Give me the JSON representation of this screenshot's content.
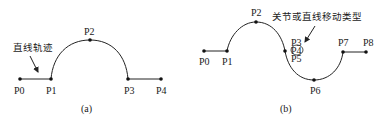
{
  "diagram_a": {
    "caption": "(a)",
    "annotation": "直线轨迹",
    "points": [
      {
        "label": "P0",
        "x": 20,
        "y": 79
      },
      {
        "label": "P1",
        "x": 51,
        "y": 79
      },
      {
        "label": "P2",
        "x": 90,
        "y": 40
      },
      {
        "label": "P3",
        "x": 128,
        "y": 79
      },
      {
        "label": "P4",
        "x": 161,
        "y": 79
      }
    ]
  },
  "diagram_b": {
    "caption": "(b)",
    "annotation": "关节或直线移动类型",
    "points": [
      {
        "label": "P0",
        "x": 204,
        "y": 51
      },
      {
        "label": "P1",
        "x": 227,
        "y": 51
      },
      {
        "label": "P2",
        "x": 256,
        "y": 22
      },
      {
        "label": "P3",
        "x": 285,
        "y": 51
      },
      {
        "label": "P4",
        "x": 292,
        "y": 51
      },
      {
        "label": "P5",
        "x": 292,
        "y": 51
      },
      {
        "label": "P6",
        "x": 314,
        "y": 80
      },
      {
        "label": "P7",
        "x": 343,
        "y": 52
      },
      {
        "label": "P8",
        "x": 366,
        "y": 52
      }
    ]
  },
  "colors": {
    "line": "#222222",
    "text": "#1a1a1a",
    "background": "#ffffff"
  }
}
